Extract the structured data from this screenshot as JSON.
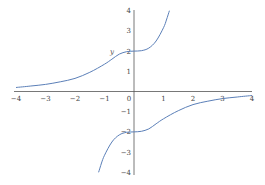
{
  "chart_data": {
    "type": "line",
    "title": "",
    "xlabel": "",
    "ylabel": "y",
    "xlim": [
      -4,
      4
    ],
    "ylim": [
      -4,
      4
    ],
    "grid": false,
    "legend": null,
    "x_ticks": [
      "-4",
      "-3",
      "-2",
      "-1",
      "0",
      "1",
      "2",
      "3",
      "4"
    ],
    "y_ticks": [
      "4",
      "3",
      "2",
      "1",
      "-1",
      "-2",
      "-3",
      "-4"
    ],
    "color": "#5b7fb8",
    "series": [
      {
        "name": "upper branch",
        "x": [
          -4,
          -3.5,
          -3,
          -2.5,
          -2,
          -1.5,
          -1,
          -0.75,
          -0.5,
          -0.25,
          0,
          0.25,
          0.5,
          0.75,
          1,
          1.1,
          1.2
        ],
        "y": [
          0.2,
          0.27,
          0.35,
          0.48,
          0.65,
          0.95,
          1.35,
          1.6,
          1.85,
          1.97,
          2,
          2.02,
          2.15,
          2.5,
          3.16,
          3.54,
          4
        ]
      },
      {
        "name": "lower branch",
        "x": [
          -1.2,
          -1.1,
          -1,
          -0.75,
          -0.5,
          -0.25,
          0,
          0.25,
          0.5,
          0.75,
          1,
          1.5,
          2,
          2.5,
          3,
          3.5,
          4
        ],
        "y": [
          -4,
          -3.54,
          -3.16,
          -2.5,
          -2.15,
          -2.02,
          -2,
          -1.97,
          -1.85,
          -1.6,
          -1.35,
          -0.95,
          -0.65,
          -0.48,
          -0.35,
          -0.27,
          -0.2
        ]
      }
    ]
  },
  "labels": {
    "y_axis_label": "y"
  }
}
